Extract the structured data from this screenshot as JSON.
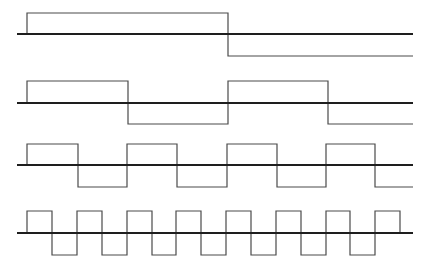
{
  "diagram": {
    "title": "",
    "colors": {
      "axis": "#1e1e1e",
      "wave": "#4a4a4a",
      "background": "#ffffff"
    },
    "x_start": 17,
    "x_end": 413,
    "rows": [
      {
        "name": "wave-1",
        "axis_y": 34,
        "high_y": 13,
        "low_y": 56,
        "start_x": 27,
        "transitions": [
          27,
          228
        ],
        "end_x": 413,
        "end_state": "low"
      },
      {
        "name": "wave-2",
        "axis_y": 103,
        "high_y": 81,
        "low_y": 124,
        "start_x": 27,
        "transitions": [
          27,
          128,
          228,
          328
        ],
        "end_x": 413,
        "end_state": "low"
      },
      {
        "name": "wave-3",
        "axis_y": 165,
        "high_y": 144,
        "low_y": 187,
        "start_x": 27,
        "transitions": [
          27,
          78,
          127,
          177,
          227,
          277,
          326,
          375
        ],
        "end_x": 413,
        "end_state": "low"
      },
      {
        "name": "wave-4",
        "axis_y": 233,
        "high_y": 211,
        "low_y": 255,
        "start_x": 27,
        "transitions": [
          27,
          52,
          77,
          102,
          127,
          152,
          176,
          201,
          226,
          251,
          276,
          301,
          326,
          350,
          375,
          400
        ],
        "end_x": 400,
        "end_state": "axis"
      }
    ]
  }
}
